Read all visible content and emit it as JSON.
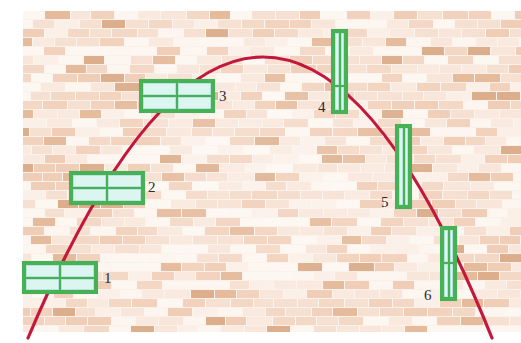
{
  "figure": {
    "kind": "physics-illustration-projectile-through-windows",
    "background": {
      "name": "brick-wall",
      "base_color": "#f6e0d3",
      "mortar_color": "#fdf4ee",
      "accent_brick_color": "#dcae8c",
      "brick_width_px": 26,
      "brick_height_px": 9,
      "area": {
        "x": 23,
        "y": 11,
        "width": 498,
        "height": 321
      }
    },
    "trajectory": {
      "name": "projectile-parabola",
      "color": "#c2183c",
      "stroke_width": 3.2,
      "shape": "downward-opening parabola",
      "apex": {
        "x": 266,
        "y": 57
      },
      "start": {
        "x": 28,
        "y": 338
      },
      "end": {
        "x": 492,
        "y": 338
      },
      "direction": "left-to-right, rising then falling"
    },
    "windows": [
      {
        "label": "1",
        "orientation": "horizontal",
        "rect": {
          "x": 22,
          "y": 261,
          "width": 76,
          "height": 33
        },
        "columns": 2,
        "rows": 2,
        "label_pos": {
          "x": 104,
          "y": 271
        },
        "frame_color": "#47b255",
        "pane_color": "#ddf5f1"
      },
      {
        "label": "2",
        "orientation": "horizontal",
        "rect": {
          "x": 69,
          "y": 171,
          "width": 76,
          "height": 34
        },
        "columns": 2,
        "rows": 2,
        "label_pos": {
          "x": 148,
          "y": 180
        },
        "frame_color": "#47b255",
        "pane_color": "#ddf5f1"
      },
      {
        "label": "3",
        "orientation": "horizontal",
        "rect": {
          "x": 139,
          "y": 79,
          "width": 76,
          "height": 34
        },
        "columns": 2,
        "rows": 2,
        "label_pos": {
          "x": 219,
          "y": 89
        },
        "frame_color": "#47b255",
        "pane_color": "#ddf5f1"
      },
      {
        "label": "4",
        "orientation": "vertical",
        "rect": {
          "x": 331,
          "y": 29,
          "width": 17,
          "height": 85
        },
        "columns": 2,
        "rows": 2,
        "row_split": 0.68,
        "label_pos": {
          "x": 318,
          "y": 100
        },
        "frame_color": "#47b255",
        "pane_color": "#ddf5f1"
      },
      {
        "label": "5",
        "orientation": "vertical",
        "rect": {
          "x": 395,
          "y": 124,
          "width": 17,
          "height": 85
        },
        "columns": 2,
        "rows": 1,
        "label_pos": {
          "x": 381,
          "y": 195
        },
        "frame_color": "#47b255",
        "pane_color": "#ddf5f1"
      },
      {
        "label": "6",
        "orientation": "vertical",
        "rect": {
          "x": 440,
          "y": 226,
          "width": 17,
          "height": 75
        },
        "columns": 2,
        "rows": 2,
        "row_split": 0.48,
        "label_pos": {
          "x": 424,
          "y": 288
        },
        "frame_color": "#47b255",
        "pane_color": "#ddf5f1"
      }
    ],
    "impact_markers": [
      {
        "window": "1",
        "x": 46,
        "y": 280
      },
      {
        "window": "2",
        "x": 97,
        "y": 187
      },
      {
        "window": "3",
        "x": 175,
        "y": 96
      },
      {
        "window": "4",
        "x": 341,
        "y": 92
      },
      {
        "window": "5",
        "x": 404,
        "y": 166
      },
      {
        "window": "6",
        "x": 450,
        "y": 245
      }
    ]
  }
}
